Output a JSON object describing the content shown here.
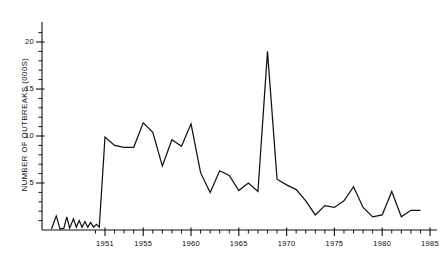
{
  "chart_data": {
    "type": "line",
    "title": "",
    "xlabel": "",
    "ylabel": "NUMBER OF OUTBREAKS (000S)",
    "xlim": [
      1945.0,
      1985.0
    ],
    "ylim": [
      0,
      21.5
    ],
    "grid": false,
    "legend": null,
    "y_ticks_major": [
      5,
      10,
      15,
      20
    ],
    "y_ticks_major_labels": [
      "5",
      "10",
      "15",
      "20"
    ],
    "y_tick_minor_step": 1,
    "x_ticks_major": [
      1951,
      1955,
      1960,
      1965,
      1970,
      1975,
      1980,
      1985
    ],
    "x_ticks_major_labels": [
      "1951",
      "1955",
      "1960",
      "1965",
      "1970",
      "1975",
      "1980",
      "1985"
    ],
    "x_tick_minor_step": 1,
    "series": [
      {
        "name": "outbreaks",
        "color": "#111111",
        "x": [
          1945.4,
          1945.9,
          1946.3,
          1946.7,
          1947.0,
          1947.3,
          1947.7,
          1948.0,
          1948.3,
          1948.6,
          1948.9,
          1949.2,
          1949.5,
          1949.8,
          1950.1,
          1950.4,
          1951,
          1952,
          1953,
          1954,
          1955,
          1956,
          1957,
          1958,
          1959,
          1960,
          1961,
          1962,
          1963,
          1964,
          1965,
          1966,
          1967,
          1968,
          1969,
          1970,
          1971,
          1972,
          1973,
          1974,
          1975,
          1976,
          1977,
          1978,
          1979,
          1980,
          1981,
          1982,
          1983,
          1984
        ],
        "y": [
          0.1,
          1.5,
          0.1,
          0.2,
          1.4,
          0.2,
          1.2,
          0.3,
          1.0,
          0.3,
          0.9,
          0.3,
          0.8,
          0.3,
          0.6,
          0.3,
          9.9,
          9.0,
          8.8,
          8.8,
          11.4,
          10.4,
          6.8,
          9.6,
          8.9,
          11.3,
          6.1,
          4.0,
          6.3,
          5.8,
          4.2,
          5.0,
          4.1,
          19.0,
          5.4,
          4.8,
          4.3,
          3.1,
          1.6,
          2.6,
          2.4,
          3.1,
          4.6,
          2.4,
          1.4,
          1.6,
          4.1,
          1.4,
          2.1,
          2.1
        ]
      }
    ]
  },
  "axis_title": "NUMBER OF OUTBREAKS (000S)"
}
